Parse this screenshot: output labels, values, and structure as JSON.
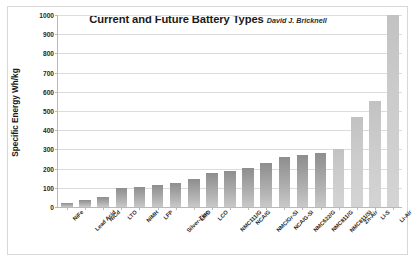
{
  "chart_data": {
    "type": "bar",
    "title": "Current and Future Battery Types",
    "credit": "David J. Bricknell",
    "xlabel": "",
    "ylabel": "Specific Energy Wh/kg",
    "ylim": [
      0,
      1000
    ],
    "ytick_step": 100,
    "ytick_labels": [
      "0",
      "100",
      "200",
      "300",
      "400",
      "500",
      "600",
      "700",
      "800",
      "900",
      "1000"
    ],
    "grid": true,
    "legend": false,
    "categories": [
      "NiFe",
      "Lead Acid",
      "NiCd",
      "LTO",
      "NiMH",
      "LFP",
      "Silver-Zinc",
      "LMO",
      "LCO",
      "NMC111/G",
      "NCA/G",
      "NMC/Gr-Si",
      "NCA/G-Si",
      "NMC622/G",
      "NMC811/G",
      "NMC811/Si",
      "Zn-Air",
      "Li-S",
      "Li-Air"
    ],
    "values": [
      20,
      35,
      50,
      100,
      105,
      115,
      125,
      145,
      175,
      190,
      205,
      230,
      262,
      270,
      280,
      300,
      470,
      550,
      1000
    ],
    "bar_styles": [
      "dark",
      "dark",
      "dark",
      "dark",
      "dark",
      "dark",
      "dark",
      "dark",
      "dark",
      "dark",
      "dark",
      "dark",
      "dark",
      "dark",
      "dark",
      "light",
      "light",
      "light",
      "light"
    ],
    "colors": {
      "bar_dark_top": "#8e8e8e",
      "bar_dark_bottom": "#c9c9c9",
      "bar_light_top": "#c2c2c2",
      "bar_light_bottom": "#d4d4d4",
      "gridline": "#dcdcdc",
      "axis": "#b9b9b9",
      "frame": "#d8d8d8",
      "background": "#ffffff",
      "text": "#1a1a1a"
    }
  }
}
